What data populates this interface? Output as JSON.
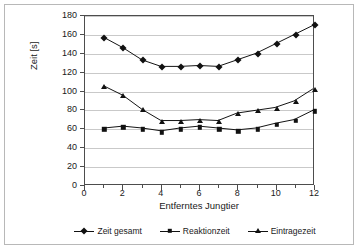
{
  "chart_data": {
    "type": "line",
    "title": "",
    "xlabel": "Entferntes Jungtier",
    "ylabel": "Zeit [s]",
    "xlim": [
      0,
      12
    ],
    "ylim": [
      0,
      180
    ],
    "x": [
      1,
      2,
      3,
      4,
      5,
      6,
      7,
      8,
      9,
      10,
      11,
      12
    ],
    "xticks": [
      0,
      2,
      4,
      6,
      8,
      10,
      12
    ],
    "xtick_labels": [
      "0",
      "2",
      "4",
      "6",
      "8",
      "10",
      "12"
    ],
    "x_minor_ticks": [
      0,
      1,
      2,
      3,
      4,
      5,
      6,
      7,
      8,
      9,
      10,
      11,
      12
    ],
    "yticks": [
      0,
      20,
      40,
      60,
      80,
      100,
      120,
      140,
      160,
      180
    ],
    "ytick_labels": [
      "0",
      "20",
      "40",
      "60",
      "80",
      "100",
      "120",
      "140",
      "160",
      "180"
    ],
    "grid": "horizontal",
    "legend_position": "bottom",
    "series": [
      {
        "name": "Zeit gesamt",
        "marker": "diamond",
        "color": "#111111",
        "values": [
          157,
          146,
          133,
          126,
          126,
          127,
          126,
          133,
          140,
          150,
          160,
          170
        ]
      },
      {
        "name": "Reaktionzeit",
        "marker": "square",
        "color": "#111111",
        "values": [
          60,
          62,
          60,
          57,
          60,
          62,
          60,
          58,
          60,
          65,
          69,
          79
        ]
      },
      {
        "name": "Eintragezeit",
        "marker": "triangle",
        "color": "#111111",
        "values": [
          105,
          95,
          80,
          68,
          68,
          69,
          68,
          76,
          79,
          82,
          89,
          102
        ]
      }
    ]
  },
  "colors": {
    "plot_border": "#4d4d4d",
    "gridline": "#c9c9c9",
    "series": "#111111",
    "frame": "#b8b8b8",
    "background": "#ffffff"
  }
}
